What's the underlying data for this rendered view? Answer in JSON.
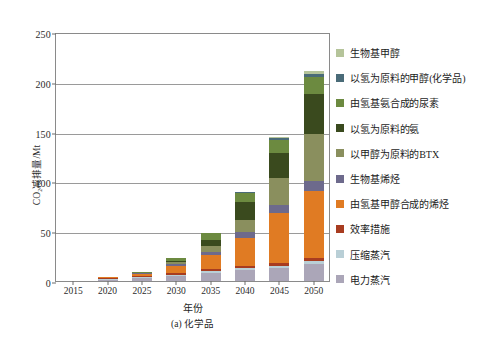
{
  "chart_data": {
    "type": "bar",
    "stacked": true,
    "title": "",
    "xlabel": "年份",
    "ylabel": "CO₂减排量/Mt",
    "caption": "(a) 化学品",
    "categories": [
      "2015",
      "2020",
      "2025",
      "2030",
      "2035",
      "2040",
      "2045",
      "2050"
    ],
    "ylim": [
      0,
      250
    ],
    "yticks": [
      0,
      50,
      100,
      150,
      200,
      250
    ],
    "ytick_labels": [
      "0",
      "50",
      "100",
      "150",
      "200",
      "250"
    ],
    "grid": true,
    "legend_position": "right",
    "series": [
      {
        "name": "生物基甲醇",
        "color": "#b5c49a",
        "values": [
          0,
          0,
          0,
          0,
          0,
          0,
          1.5,
          3.0
        ]
      },
      {
        "name": "以氢为原料的甲醇(化学品)",
        "color": "#4a6b78",
        "values": [
          0,
          0,
          0,
          0,
          0.5,
          0.8,
          1.5,
          3.5
        ]
      },
      {
        "name": "由氢基氨合成的尿素",
        "color": "#6c8a40",
        "values": [
          0,
          0.4,
          1.0,
          3.0,
          6.5,
          9.0,
          13.0,
          17.0
        ]
      },
      {
        "name": "以氢为原料的氨",
        "color": "#3a4a1e",
        "values": [
          0,
          0,
          0,
          1.5,
          6.0,
          18.0,
          26.0,
          40.0
        ]
      },
      {
        "name": "以甲醇为原料的BTX",
        "color": "#8a8f5e",
        "values": [
          0,
          0,
          0.6,
          2.0,
          6.0,
          12.0,
          27.0,
          47.0
        ]
      },
      {
        "name": "生物基烯烃",
        "color": "#6d6a8c",
        "values": [
          0,
          0,
          0.5,
          1.5,
          3.5,
          6.0,
          8.0,
          10.0
        ]
      },
      {
        "name": "由氢基甲醇合成的烯烃",
        "color": "#e07b23",
        "values": [
          0,
          0.8,
          2.0,
          7.0,
          14.0,
          28.0,
          50.0,
          68.0
        ]
      },
      {
        "name": "效率措施",
        "color": "#a83c20",
        "values": [
          0,
          1.2,
          1.5,
          1.8,
          2.0,
          2.2,
          2.5,
          2.8
        ]
      },
      {
        "name": "压缩蒸汽",
        "color": "#b9cfd6",
        "values": [
          0,
          0.4,
          0.6,
          1.0,
          1.5,
          2.0,
          2.5,
          3.0
        ]
      },
      {
        "name": "电力蒸汽",
        "color": "#aba6b8",
        "values": [
          0,
          1.5,
          3.0,
          5.5,
          8.5,
          11.0,
          13.0,
          17.0
        ]
      }
    ],
    "totals": [
      0,
      4.3,
      9.2,
      23.3,
      48.5,
      89.0,
      145.0,
      211.3
    ]
  },
  "meta": {
    "y_unit": "Mt",
    "x_unit": "year"
  }
}
